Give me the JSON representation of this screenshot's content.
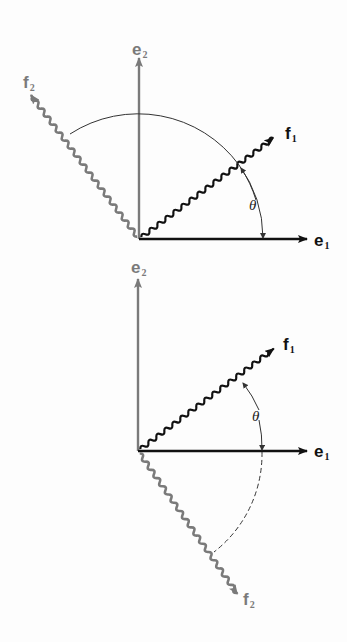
{
  "colors": {
    "background": "#fdfdfd",
    "e_vectors_black": "#111111",
    "gray_vectors": "#7a7a7a",
    "arc": "#333333"
  },
  "top_diagram": {
    "title": "rotation (proper)",
    "origin": [
      139,
      239
    ],
    "labels": {
      "e1": {
        "base": "e",
        "sub": "1"
      },
      "e2": {
        "base": "e",
        "sub": "2"
      },
      "f1": {
        "base": "f",
        "sub": "1"
      },
      "f2": {
        "base": "f",
        "sub": "2"
      },
      "angle": "θ"
    }
  },
  "bottom_diagram": {
    "title": "reflection",
    "origin": [
      138,
      451
    ],
    "labels": {
      "e1": {
        "base": "e",
        "sub": "1"
      },
      "e2": {
        "base": "e",
        "sub": "2"
      },
      "f1": {
        "base": "f",
        "sub": "1"
      },
      "f2": {
        "base": "f",
        "sub": "2"
      },
      "angle": "θ"
    }
  }
}
